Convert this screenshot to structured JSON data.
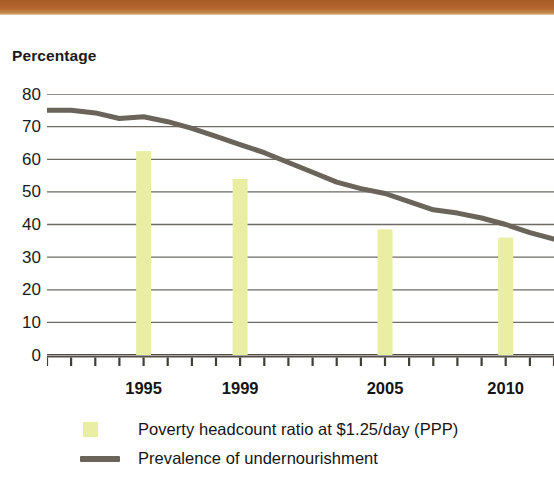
{
  "decor": {
    "top_band_color": "#b0602b"
  },
  "axis": {
    "y_title": "Percentage",
    "y_ticks": [
      80,
      70,
      60,
      50,
      40,
      30,
      20,
      10,
      0
    ],
    "y_min": 0,
    "y_max": 80,
    "x_labels": [
      {
        "text": "1995",
        "year": 1995
      },
      {
        "text": "1999",
        "year": 1999
      },
      {
        "text": "2005",
        "year": 2005
      },
      {
        "text": "2010",
        "year": 2010
      }
    ],
    "x_min": 1991,
    "x_max": 2012,
    "x_tick_years": [
      1991,
      1992,
      1993,
      1994,
      1995,
      1996,
      1997,
      1998,
      1999,
      2000,
      2001,
      2002,
      2003,
      2004,
      2005,
      2006,
      2007,
      2008,
      2009,
      2010,
      2011,
      2012
    ]
  },
  "legend": {
    "items": [
      {
        "label": "Poverty headcount ratio at $1.25/day (PPP)",
        "marker": "square",
        "color": "#e9eea2"
      },
      {
        "label": "Prevalence of undernourishment",
        "marker": "line",
        "color": "#6a645a"
      }
    ]
  },
  "chart_data": {
    "type": "bar",
    "title": "",
    "subtitle": "",
    "xlabel": "",
    "ylabel": "Percentage",
    "ylim": [
      0,
      80
    ],
    "xlim": [
      1991,
      2012
    ],
    "grid": true,
    "legend_position": "bottom",
    "x_tick_labels": [
      "1995",
      "1999",
      "2005",
      "2010"
    ],
    "y_tick_labels": [
      "0",
      "10",
      "20",
      "30",
      "40",
      "50",
      "60",
      "70",
      "80"
    ],
    "series": [
      {
        "name": "Poverty headcount ratio at $1.25/day (PPP)",
        "type": "bar",
        "color": "#e9eea2",
        "x": [
          1995,
          1999,
          2005,
          2010
        ],
        "values": [
          62.5,
          54.0,
          38.5,
          36.0
        ]
      },
      {
        "name": "Prevalence of undernourishment",
        "type": "line",
        "color": "#6a645a",
        "x": [
          1991,
          1992,
          1993,
          1994,
          1995,
          1996,
          1997,
          1998,
          1999,
          2000,
          2001,
          2002,
          2003,
          2004,
          2005,
          2006,
          2007,
          2008,
          2009,
          2010,
          2011,
          2012
        ],
        "values": [
          75.0,
          75.0,
          74.2,
          72.5,
          73.0,
          71.5,
          69.5,
          67.0,
          64.5,
          62.0,
          59.0,
          56.0,
          53.0,
          51.0,
          49.5,
          47.0,
          44.5,
          43.5,
          42.0,
          40.0,
          37.5,
          35.5
        ]
      }
    ]
  }
}
